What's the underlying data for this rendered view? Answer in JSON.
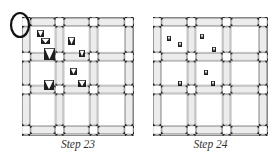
{
  "panels": [
    {
      "id": "step23",
      "caption": "Step 23",
      "left": 22,
      "width": 112,
      "highlight_circle": true,
      "markers": [
        {
          "x": 37,
          "y": 30,
          "w": 7,
          "h": 7,
          "size": "small"
        },
        {
          "x": 41,
          "y": 38,
          "w": 9,
          "h": 6,
          "size": "small"
        },
        {
          "x": 44,
          "y": 48,
          "w": 11,
          "h": 12,
          "size": "large"
        },
        {
          "x": 68,
          "y": 37,
          "w": 7,
          "h": 8,
          "size": "medium"
        },
        {
          "x": 79,
          "y": 50,
          "w": 6,
          "h": 7,
          "size": "small"
        },
        {
          "x": 70,
          "y": 68,
          "w": 7,
          "h": 7,
          "size": "medium"
        },
        {
          "x": 44,
          "y": 80,
          "w": 10,
          "h": 10,
          "size": "large"
        },
        {
          "x": 78,
          "y": 80,
          "w": 8,
          "h": 7,
          "size": "medium"
        }
      ]
    },
    {
      "id": "step24",
      "caption": "Step 24",
      "left": 153,
      "width": 115,
      "highlight_circle": false,
      "markers": [
        {
          "x": 167,
          "y": 36,
          "w": 4,
          "h": 5,
          "size": "tiny"
        },
        {
          "x": 178,
          "y": 42,
          "w": 4,
          "h": 5,
          "size": "tiny"
        },
        {
          "x": 200,
          "y": 34,
          "w": 4,
          "h": 5,
          "size": "tiny"
        },
        {
          "x": 212,
          "y": 47,
          "w": 4,
          "h": 5,
          "size": "tiny"
        },
        {
          "x": 204,
          "y": 70,
          "w": 4,
          "h": 5,
          "size": "tiny"
        },
        {
          "x": 178,
          "y": 81,
          "w": 4,
          "h": 5,
          "size": "tiny"
        },
        {
          "x": 211,
          "y": 81,
          "w": 4,
          "h": 5,
          "size": "tiny"
        }
      ]
    }
  ],
  "colors": {
    "sashing_fill": "#ececec",
    "line": "#888888",
    "star": "#222222",
    "marker": "#1e1e1e",
    "circle": "#111111"
  }
}
